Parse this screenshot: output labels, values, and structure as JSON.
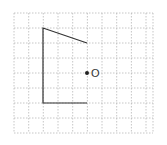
{
  "diagram": {
    "type": "grid-geometry",
    "grid": {
      "left": 14,
      "top": 13,
      "right": 153,
      "bottom": 133,
      "col_spacing": 14.67,
      "row_spacing": 15,
      "line_color": "#b8b8b8",
      "style": "dashed"
    },
    "shape": {
      "kind": "open-polyline",
      "points": [
        [
          87,
          43
        ],
        [
          43,
          28
        ],
        [
          43,
          103
        ],
        [
          87,
          103
        ]
      ],
      "stroke_color": "#333333"
    },
    "point": {
      "label": "O",
      "x": 87,
      "y": 73,
      "color": "#222222"
    }
  }
}
